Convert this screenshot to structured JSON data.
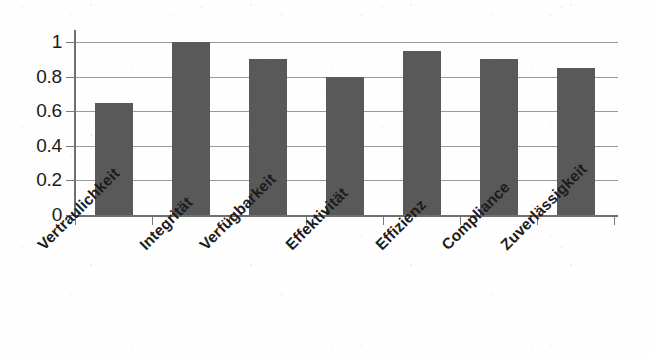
{
  "chart_data": {
    "type": "bar",
    "title": "",
    "subtitle": "",
    "xlabel": "",
    "ylabel": "",
    "categories": [
      "Vertraulichkeit",
      "Integrität",
      "Verfügbarkeit",
      "Effektivität",
      "Effizienz",
      "Compliance",
      "Zuverlässigkeit"
    ],
    "values": [
      0.65,
      1.0,
      0.9,
      0.8,
      0.95,
      0.9,
      0.85
    ],
    "ylim": [
      0,
      1
    ],
    "ytick_labels": [
      "1",
      "0.8",
      "0.6",
      "0.4",
      "0.2",
      "0"
    ],
    "ytick_values": [
      1,
      0.8,
      0.6,
      0.4,
      0.2,
      0
    ],
    "grid": true,
    "grid_axis": "y",
    "legend": false,
    "legend_position": "none",
    "bar_color": "#595959",
    "gridline_color": "#9a9a9a",
    "axis_color": "#6f6f6f",
    "text_color": "#1a1a1a",
    "background_color": "#fefefe",
    "category_label_rotation": -45
  }
}
